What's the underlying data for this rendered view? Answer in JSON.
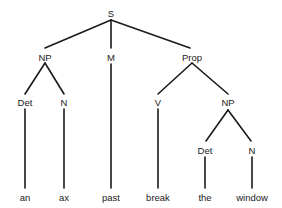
{
  "diagram": {
    "type": "syntax-tree",
    "nodes": [
      {
        "id": "S",
        "label": "S",
        "x": 111,
        "y": 14
      },
      {
        "id": "NP1",
        "label": "NP",
        "x": 45,
        "y": 58
      },
      {
        "id": "M",
        "label": "M",
        "x": 111,
        "y": 58
      },
      {
        "id": "Prop",
        "label": "Prop",
        "x": 192,
        "y": 58
      },
      {
        "id": "Det1",
        "label": "Det",
        "x": 25,
        "y": 103
      },
      {
        "id": "N1",
        "label": "N",
        "x": 64,
        "y": 103
      },
      {
        "id": "V",
        "label": "V",
        "x": 158,
        "y": 103
      },
      {
        "id": "NP2",
        "label": "NP",
        "x": 228,
        "y": 103
      },
      {
        "id": "Det2",
        "label": "Det",
        "x": 205,
        "y": 151
      },
      {
        "id": "N2",
        "label": "N",
        "x": 252,
        "y": 151
      },
      {
        "id": "an",
        "label": "an",
        "x": 25,
        "y": 198
      },
      {
        "id": "ax",
        "label": "ax",
        "x": 64,
        "y": 198
      },
      {
        "id": "past",
        "label": "past",
        "x": 111,
        "y": 198
      },
      {
        "id": "break",
        "label": "break",
        "x": 158,
        "y": 198
      },
      {
        "id": "the",
        "label": "the",
        "x": 205,
        "y": 198
      },
      {
        "id": "window",
        "label": "window",
        "x": 252,
        "y": 198
      }
    ],
    "edges": [
      {
        "from": "S",
        "to": "NP1",
        "x1": 111,
        "y1": 20,
        "x2": 45,
        "y2": 48
      },
      {
        "from": "S",
        "to": "M",
        "x1": 111,
        "y1": 20,
        "x2": 111,
        "y2": 48
      },
      {
        "from": "S",
        "to": "Prop",
        "x1": 111,
        "y1": 20,
        "x2": 190,
        "y2": 48
      },
      {
        "from": "NP1",
        "to": "Det1",
        "x1": 45,
        "y1": 63,
        "x2": 25,
        "y2": 94
      },
      {
        "from": "NP1",
        "to": "N1",
        "x1": 45,
        "y1": 63,
        "x2": 64,
        "y2": 94
      },
      {
        "from": "M",
        "to": "past",
        "x1": 111,
        "y1": 64,
        "x2": 111,
        "y2": 188
      },
      {
        "from": "Prop",
        "to": "V",
        "x1": 192,
        "y1": 63,
        "x2": 158,
        "y2": 94
      },
      {
        "from": "Prop",
        "to": "NP2",
        "x1": 192,
        "y1": 63,
        "x2": 228,
        "y2": 94
      },
      {
        "from": "Det1",
        "to": "an",
        "x1": 25,
        "y1": 109,
        "x2": 25,
        "y2": 188
      },
      {
        "from": "N1",
        "to": "ax",
        "x1": 64,
        "y1": 109,
        "x2": 64,
        "y2": 188
      },
      {
        "from": "V",
        "to": "break",
        "x1": 158,
        "y1": 109,
        "x2": 158,
        "y2": 188
      },
      {
        "from": "NP2",
        "to": "Det2",
        "x1": 228,
        "y1": 110,
        "x2": 206,
        "y2": 141
      },
      {
        "from": "NP2",
        "to": "N2",
        "x1": 228,
        "y1": 110,
        "x2": 251,
        "y2": 141
      },
      {
        "from": "Det2",
        "to": "the",
        "x1": 205,
        "y1": 157,
        "x2": 205,
        "y2": 188
      },
      {
        "from": "N2",
        "to": "window",
        "x1": 252,
        "y1": 157,
        "x2": 252,
        "y2": 188
      }
    ],
    "line_color": "#1a1a1a",
    "text_color": "#1a1a1a",
    "background": "#ffffff"
  }
}
